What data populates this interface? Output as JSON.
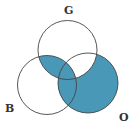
{
  "diagram": {
    "type": "venn",
    "sets": [
      {
        "id": "G",
        "label": "G",
        "cx": 67.5,
        "cy": 50,
        "r": 29.5
      },
      {
        "id": "B",
        "label": "B",
        "cx": 47,
        "cy": 85,
        "r": 29.5
      },
      {
        "id": "O",
        "label": "O",
        "cx": 88,
        "cy": 83,
        "r": 30
      }
    ],
    "shaded_regions": [
      "G∩B",
      "O∖G",
      "O∩B"
    ],
    "colors": {
      "shade": "#4a98b8",
      "stroke": "#444444",
      "background": "#ffffff"
    }
  },
  "labels": {
    "g": "G",
    "b": "B",
    "o": "O"
  }
}
